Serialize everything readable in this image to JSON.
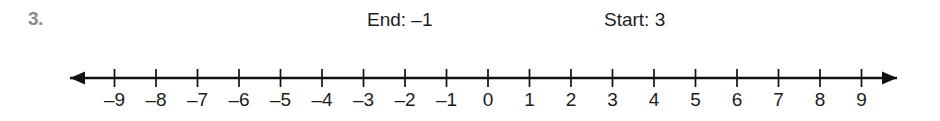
{
  "problem": {
    "number": "3."
  },
  "annotations": [
    {
      "name": "end-label",
      "text": "End: –1"
    },
    {
      "name": "start-label",
      "text": "Start: 3"
    }
  ],
  "number_line": {
    "min": -9,
    "max": 9,
    "step": 1,
    "tick_labels": [
      "–9",
      "–8",
      "–7",
      "–6",
      "–5",
      "–4",
      "–3",
      "–2",
      "–1",
      "0",
      "1",
      "2",
      "3",
      "4",
      "5",
      "6",
      "7",
      "8",
      "9"
    ],
    "left_arrow": true,
    "right_arrow": true,
    "axis_color": "#111111",
    "label_color": "#1c1c1c"
  },
  "geometry": {
    "axis_y": 78,
    "zero_x": 488,
    "unit_px": 41.5,
    "tick_half_height": 9,
    "arrow_left_tip_x": 70,
    "arrow_right_tip_x": 897
  }
}
